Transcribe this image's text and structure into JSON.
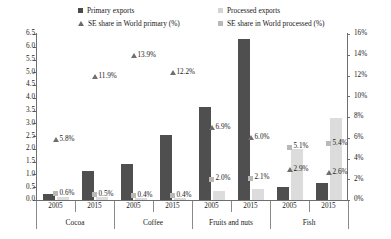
{
  "legend": {
    "items": [
      {
        "label": "Primary exports",
        "marker": "square-dark"
      },
      {
        "label": "Processed exports",
        "marker": "square-light"
      },
      {
        "label": "SE share in World primary (%)",
        "marker": "triangle"
      },
      {
        "label": "SE share in World processed (%)",
        "marker": "square-mid"
      }
    ]
  },
  "colors": {
    "primary_bar": "#4f4f4f",
    "processed_bar": "#dcdcdc",
    "triangle_marker": "#6f6f6f",
    "square_marker": "#b9b9b9",
    "axis": "#6e6e6e",
    "text": "#1a1a1a"
  },
  "chart_data": {
    "type": "bar",
    "title": "",
    "xlabel": "",
    "ylabel": "",
    "grid": false,
    "legend_position": "top",
    "groups": [
      "Cocoa",
      "Coffee",
      "Fruits and nuts",
      "Fish"
    ],
    "years": [
      "2005",
      "2015"
    ],
    "categories": [
      "Cocoa 2005",
      "Cocoa 2015",
      "Coffee 2005",
      "Coffee 2015",
      "Fruits and nuts 2005",
      "Fruits and nuts 2015",
      "Fish 2005",
      "Fish 2015"
    ],
    "left_axis": {
      "ylim": [
        0.0,
        6.5
      ],
      "tick_step": 0.5,
      "ticks": [
        "0.0",
        "0.5",
        "1.0",
        "1.5",
        "2.0",
        "2.5",
        "3.0",
        "3.5",
        "4.0",
        "4.5",
        "5.0",
        "5.5",
        "6.0",
        "6.5"
      ]
    },
    "right_axis": {
      "ylim": [
        0,
        16
      ],
      "tick_step": 2,
      "ticks": [
        "0%",
        "2%",
        "4%",
        "6%",
        "8%",
        "10%",
        "12%",
        "14%",
        "16%"
      ]
    },
    "series": [
      {
        "name": "Primary exports",
        "axis": "left",
        "type": "bar",
        "values": [
          0.25,
          1.15,
          1.4,
          2.55,
          3.65,
          6.3,
          0.5,
          0.65
        ]
      },
      {
        "name": "Processed exports",
        "axis": "left",
        "type": "bar",
        "values": [
          0.1,
          0.1,
          0.08,
          0.08,
          0.35,
          0.45,
          2.0,
          3.2
        ]
      },
      {
        "name": "SE share in World primary (%)",
        "axis": "right",
        "type": "marker",
        "marker": "triangle",
        "values": [
          5.8,
          11.9,
          13.9,
          12.2,
          6.9,
          6.0,
          2.9,
          2.6
        ],
        "labels": [
          "5.8%",
          "11.9%",
          "13.9%",
          "12.2%",
          "6.9%",
          "6.0%",
          "2.9%",
          "2.6%"
        ]
      },
      {
        "name": "SE share in World processed (%)",
        "axis": "right",
        "type": "marker",
        "marker": "square",
        "values": [
          0.6,
          0.5,
          0.4,
          0.4,
          2.0,
          2.1,
          5.1,
          5.4
        ],
        "labels": [
          "0.6%",
          "0.5%",
          "0.4%",
          "0.4%",
          "2.0%",
          "2.1%",
          "5.1%",
          "5.4%"
        ]
      }
    ]
  }
}
